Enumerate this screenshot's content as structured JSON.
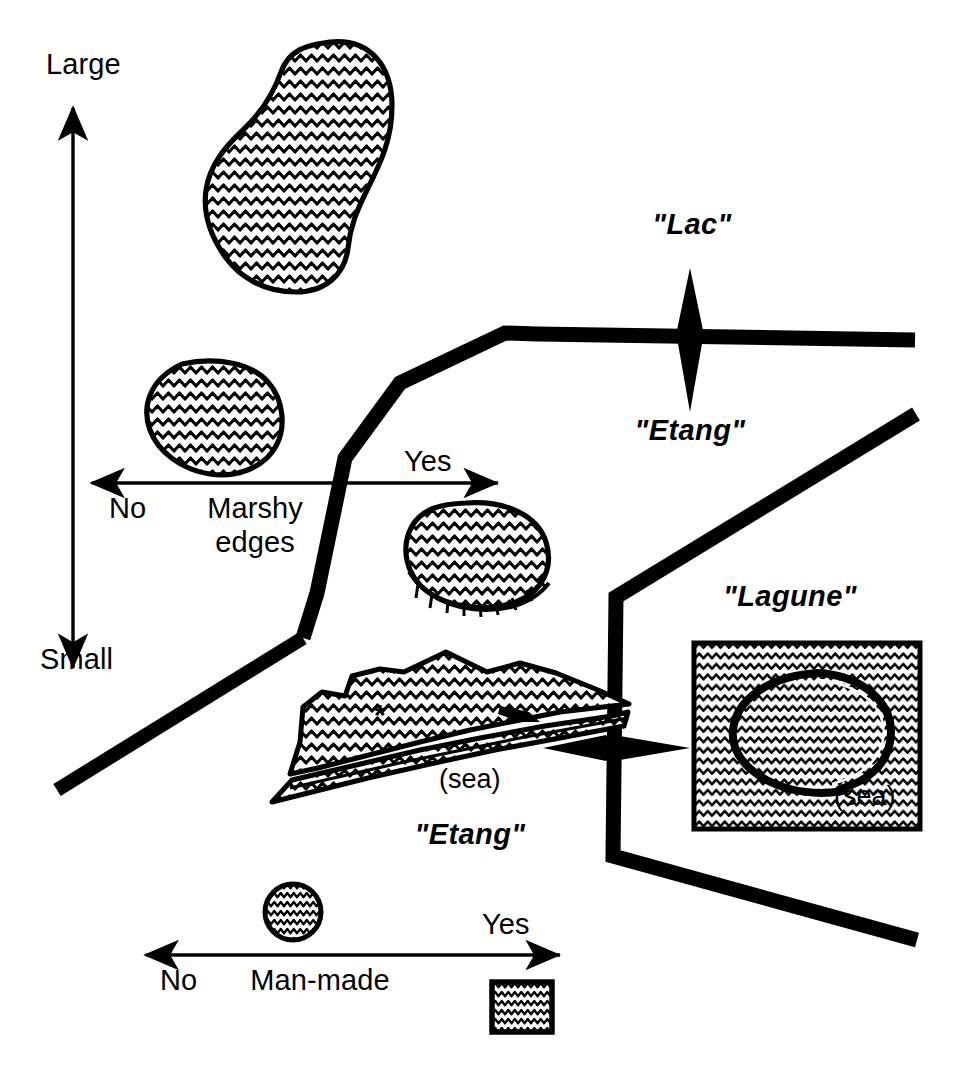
{
  "diagram": {
    "background_color": "#ffffff",
    "ink_color": "#000000",
    "axes": [
      {
        "id": "size-axis",
        "orientation": "vertical",
        "high_label": "Large",
        "low_label": "Small",
        "arrowheads": "both"
      },
      {
        "id": "marshy-edges-axis",
        "orientation": "horizontal",
        "name_line1": "Marshy",
        "name_line2": "edges",
        "left_label": "No",
        "right_label": "Yes",
        "arrowheads": "both"
      },
      {
        "id": "man-made-axis",
        "orientation": "horizontal",
        "name_line1": "Man-made",
        "name_line2": "",
        "left_label": "No",
        "right_label": "Yes",
        "arrowheads": "both"
      }
    ],
    "class_labels": [
      {
        "id": "lac",
        "text": "\"Lac\""
      },
      {
        "id": "etang-upper",
        "text": "\"Etang\""
      },
      {
        "id": "etang-coastal",
        "text": "\"Etang\""
      },
      {
        "id": "lagune",
        "text": "\"Lagune\""
      }
    ],
    "annotations": [
      {
        "id": "sea-coastal",
        "text": "(sea)"
      },
      {
        "id": "sea-lagoon",
        "text": "(sea)"
      },
      {
        "id": "asterisk-marker",
        "text": "*"
      }
    ],
    "separator_arrows": [
      {
        "id": "lac-etang-divider-arrow",
        "orientation": "vertical",
        "upper_class": "\"Lac\"",
        "lower_class": "\"Etang\""
      },
      {
        "id": "etang-lagune-divider-arrow",
        "orientation": "horizontal",
        "left_class": "\"Etang\"",
        "right_class": "\"Lagune\""
      }
    ],
    "water_bodies": [
      {
        "id": "large-lake",
        "shape": "irregular-peanut",
        "size_class": "Large",
        "marshy_edges": "No",
        "man_made": "No"
      },
      {
        "id": "medium-lake",
        "shape": "oval",
        "size_class": "Medium",
        "marshy_edges": "No",
        "man_made": "No"
      },
      {
        "id": "marshy-pond",
        "shape": "oval-with-fringe",
        "size_class": "Small",
        "marshy_edges": "Yes",
        "man_made": "No"
      },
      {
        "id": "coastal-etang",
        "shape": "coastal-lagoon-with-spit",
        "size_class": "Small",
        "marshy_edges": "Yes",
        "man_made": "No"
      },
      {
        "id": "lagune-sea-box",
        "shape": "square-sea-with-ring",
        "size_class": "Small",
        "marshy_edges": "No",
        "man_made": "No"
      },
      {
        "id": "small-natural-pond",
        "shape": "circle",
        "size_class": "Small",
        "marshy_edges": "No",
        "man_made": "No"
      },
      {
        "id": "man-made-reservoir",
        "shape": "square",
        "size_class": "Small",
        "marshy_edges": "No",
        "man_made": "Yes"
      }
    ]
  }
}
